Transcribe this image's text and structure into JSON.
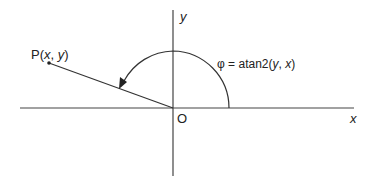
{
  "diagram": {
    "labels": {
      "point": "P(",
      "point_x": "x",
      "point_sep": ", ",
      "point_y": "y",
      "point_close": ")",
      "y_axis": "y",
      "x_axis": "x",
      "origin": "O",
      "angle_phi": "φ = atan2(",
      "angle_y": "y",
      "angle_sep": ", ",
      "angle_x": "x",
      "angle_close": ")"
    },
    "colors": {
      "line": "#333333",
      "text": "#222222"
    }
  }
}
